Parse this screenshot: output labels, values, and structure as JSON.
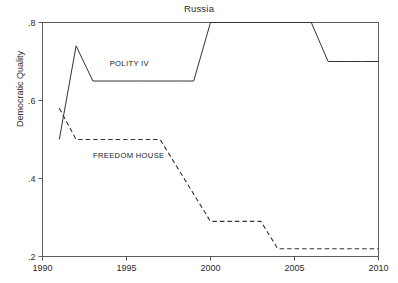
{
  "chart_data": {
    "type": "line",
    "title": "Russia",
    "xlabel": "",
    "ylabel": "Democratic Quality",
    "xlim": [
      1990,
      2010
    ],
    "ylim": [
      0.2,
      0.8
    ],
    "xticks": [
      1990,
      1995,
      2000,
      2005,
      2010
    ],
    "xtick_labels": [
      "1990",
      "1995",
      "2000",
      "2005",
      "2010"
    ],
    "yticks": [
      0.2,
      0.4,
      0.6,
      0.8
    ],
    "ytick_labels": [
      ".2",
      ".4",
      ".6",
      ".8"
    ],
    "grid": false,
    "legend_position": "inline-annotation",
    "series": [
      {
        "name": "POLITY IV",
        "label": "POLITY IV",
        "style": "solid",
        "color": "#333333",
        "x": [
          1991,
          1992,
          1993,
          1994,
          1995,
          1996,
          1997,
          1998,
          1999,
          2000,
          2001,
          2002,
          2003,
          2004,
          2005,
          2006,
          2007,
          2008,
          2009,
          2010
        ],
        "values": [
          0.5,
          0.74,
          0.65,
          0.65,
          0.65,
          0.65,
          0.65,
          0.65,
          0.65,
          0.8,
          0.8,
          0.8,
          0.8,
          0.8,
          0.8,
          0.8,
          0.7,
          0.7,
          0.7,
          0.7
        ]
      },
      {
        "name": "FREEDOM HOUSE",
        "label": "FREEDOM HOUSE",
        "style": "dashed",
        "color": "#333333",
        "x": [
          1991,
          1992,
          1993,
          1994,
          1995,
          1996,
          1997,
          1998,
          1999,
          2000,
          2001,
          2002,
          2003,
          2004,
          2005,
          2006,
          2007,
          2008,
          2009,
          2010
        ],
        "values": [
          0.58,
          0.5,
          0.5,
          0.5,
          0.5,
          0.5,
          0.5,
          0.43,
          0.36,
          0.29,
          0.29,
          0.29,
          0.29,
          0.22,
          0.22,
          0.22,
          0.22,
          0.22,
          0.22,
          0.22
        ]
      }
    ],
    "annotations": [
      {
        "text": "POLITY IV",
        "x": 1994.0,
        "y": 0.688
      },
      {
        "text": "FREEDOM HOUSE",
        "x": 1993.0,
        "y": 0.452
      }
    ]
  }
}
